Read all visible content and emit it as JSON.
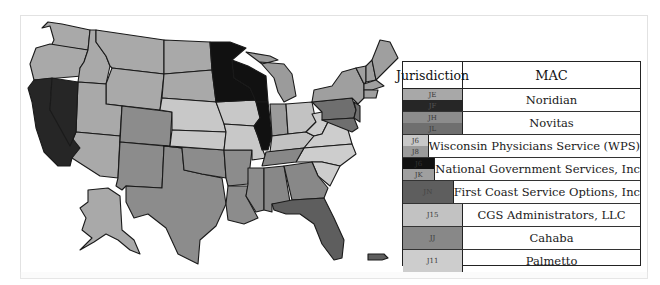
{
  "colors": {
    "JE": "#a9a9a9",
    "JF": "#222222",
    "JH": "#8f8f8f",
    "JL": "#6e6e6e",
    "J6": "#c9c9c9",
    "J8": "#9a9a9a",
    "JK": "#9d9d9d",
    "JN": "#5c5c5c",
    "J15": "#c3c3c3",
    "JJ": "#8a8a8a",
    "J11": "#cfcfcf",
    "J5_black": "#0f0f0f"
  },
  "legend": {
    "header": {
      "jurisdiction": "Jurisdiction",
      "mac": "MAC"
    },
    "rows": [
      {
        "mac": "Noridian",
        "codes": [
          {
            "code": "JE",
            "color": "#a8a8a8"
          },
          {
            "code": "JF",
            "color": "#262626"
          }
        ]
      },
      {
        "mac": "Novitas",
        "codes": [
          {
            "code": "JH",
            "color": "#8c8c8c"
          },
          {
            "code": "JL",
            "color": "#6f6f6f"
          }
        ]
      },
      {
        "mac": "Wisconsin Physicians Service (WPS)",
        "codes": [
          {
            "code": "J6",
            "color": "#c8c8c8"
          },
          {
            "code": "J8",
            "color": "#9b9b9b"
          }
        ]
      },
      {
        "mac": "National Government Services, Inc",
        "codes": [
          {
            "code": "J6",
            "color": "#111111"
          },
          {
            "code": "JK",
            "color": "#9f9f9f"
          }
        ]
      },
      {
        "mac": "First Coast Service Options, Inc",
        "codes": [
          {
            "code": "JN",
            "color": "#5e5e5e"
          }
        ]
      },
      {
        "mac": "CGS Administrators, LLC",
        "codes": [
          {
            "code": "J15",
            "color": "#c2c2c2"
          }
        ]
      },
      {
        "mac": "Cahaba",
        "codes": [
          {
            "code": "JJ",
            "color": "#888888"
          }
        ]
      },
      {
        "mac": "Palmetto",
        "codes": [
          {
            "code": "J11",
            "color": "#cdcdcd"
          }
        ]
      }
    ]
  },
  "map": {
    "title": "US Medicare Administrative Contractor jurisdictions map",
    "states": {
      "WA": "JF",
      "OR": "JF",
      "ID": "JF",
      "MT": "JF",
      "WY": "JF",
      "ND": "JF",
      "SD": "JF",
      "UT": "JF",
      "AZ": "JF",
      "AK": "JF",
      "CA": "JE",
      "NV": "JE",
      "CO": "JH",
      "NM": "JH",
      "TX": "JH",
      "OK": "JH",
      "AR": "JH",
      "LA": "JH",
      "MS": "JH",
      "PA": "JL",
      "NJ": "JL",
      "DE": "JL",
      "MD": "JL",
      "NE": "J5",
      "KS": "J5",
      "IA": "J5",
      "MO": "J5",
      "MN": "J6",
      "WI": "J6",
      "IL": "J6",
      "MI": "J8",
      "IN": "J8",
      "NY": "JK",
      "CT": "JK",
      "MA": "JK",
      "VT": "JK",
      "NH": "JK",
      "ME": "JK",
      "RI": "JK",
      "FL": "JN",
      "PR": "JN",
      "OH": "J15",
      "KY": "J15",
      "TN": "JJ",
      "AL": "JJ",
      "GA": "JJ",
      "VA": "J11",
      "WV": "J11",
      "NC": "J11",
      "SC": "J11"
    }
  }
}
